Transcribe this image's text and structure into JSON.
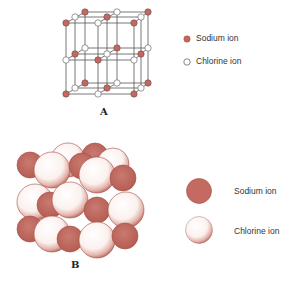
{
  "panel_a": {
    "label": "A",
    "legend": [
      {
        "label": "Sodium ion",
        "color": "#c9655c"
      },
      {
        "label": "Chlorine ion",
        "color": "#ffffff"
      }
    ]
  },
  "panel_b": {
    "label": "B",
    "legend": [
      {
        "label": "Sodium ion",
        "color": "#c46a60"
      },
      {
        "label": "Chlorine ion",
        "color": "#fbf4f2"
      }
    ]
  },
  "colors": {
    "sodium": "#c9655c",
    "chlorine": "#ffffff",
    "line": "#444444"
  }
}
